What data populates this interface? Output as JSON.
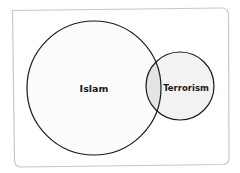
{
  "diagram": {
    "type": "venn",
    "colors": {
      "background": "#ffffff",
      "frame_stroke": "#c8c8c8",
      "circle_stroke": "#1a1a1a",
      "set_a_fill": "#fbfbfb",
      "set_b_fill": "#f2f2f2",
      "overlap_fill": "#e4e4e4",
      "label": "#1a1a1a"
    },
    "sets": [
      {
        "label": "Islam",
        "cx": 94,
        "cy": 88,
        "r": 67
      },
      {
        "label": "Terrorism",
        "cx": 180,
        "cy": 86,
        "r": 34
      }
    ]
  }
}
